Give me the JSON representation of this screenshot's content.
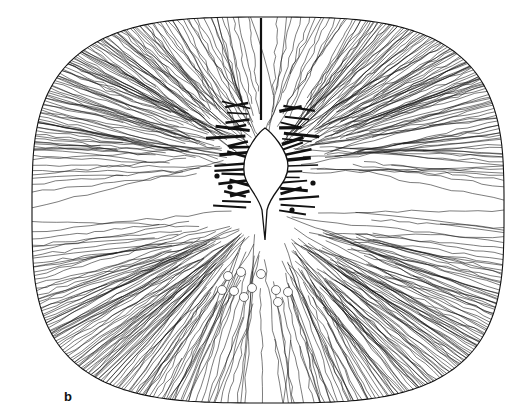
{
  "figure": {
    "panel_label": "b",
    "outline": {
      "cx": 268,
      "cy": 210,
      "rx": 236,
      "ry": 193,
      "squareness": 3.2
    },
    "central_canal": {
      "top_y": 128,
      "bulb_cx": 265,
      "bulb_cy": 160,
      "bulb_r": 23,
      "tail_bottom_y": 240
    },
    "midline_septum": {
      "x": 261,
      "y1": 18,
      "y2": 120
    },
    "colors": {
      "ink": "#111111",
      "paper": "#ffffff"
    },
    "cell_bodies": [
      {
        "x": 313,
        "y": 183
      },
      {
        "x": 217,
        "y": 176
      },
      {
        "x": 292,
        "y": 210
      },
      {
        "x": 230,
        "y": 187
      }
    ],
    "circles": [
      {
        "x": 228,
        "y": 276
      },
      {
        "x": 241,
        "y": 272
      },
      {
        "x": 222,
        "y": 290
      },
      {
        "x": 234,
        "y": 291
      },
      {
        "x": 252,
        "y": 288
      },
      {
        "x": 261,
        "y": 274
      },
      {
        "x": 244,
        "y": 297
      },
      {
        "x": 276,
        "y": 290
      },
      {
        "x": 288,
        "y": 292
      },
      {
        "x": 278,
        "y": 302
      }
    ]
  }
}
